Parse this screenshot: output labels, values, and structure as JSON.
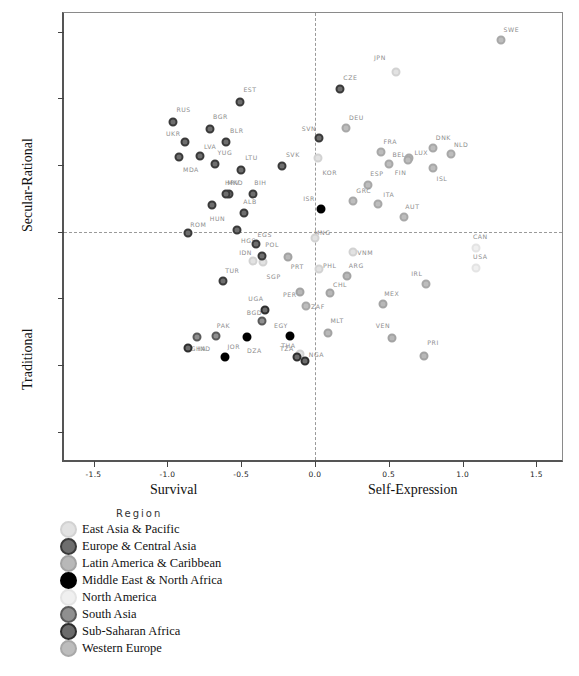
{
  "chart_data": {
    "type": "scatter",
    "title": "",
    "xlabel_left": "Survival",
    "xlabel_right": "Self-Expression",
    "ylabel_top": "Secular-Rational",
    "ylabel_bottom": "Traditional",
    "xlim": [
      -1.7,
      1.68
    ],
    "ylim": [
      -1.72,
      1.64
    ],
    "xticks": [
      "-1.5",
      "-1.0",
      "-0.5",
      "0.0",
      "0.5",
      "1.0",
      "1.5"
    ],
    "xtick_values": [
      -1.5,
      -1.0,
      -0.5,
      0.0,
      0.5,
      1.0,
      1.5
    ],
    "yticks": [
      "1.5",
      "1.0",
      "0.5",
      "0.0",
      "-0.5",
      "-1.0",
      "-1.5"
    ],
    "ytick_values": [
      1.5,
      1.0,
      0.5,
      0.0,
      -0.5,
      -1.0,
      -1.5
    ],
    "grid": false,
    "zero_lines": true,
    "legend_position": "below-plot",
    "legend_title": "Region",
    "series": [
      {
        "name": "East Asia & Pacific",
        "color": "#e2e2e2",
        "stroke": "#d2d2d2",
        "points": [
          {
            "label": "JPN",
            "x": 0.55,
            "y": 1.2,
            "lx": 0.44,
            "ly": 1.31
          },
          {
            "label": "KOR",
            "x": 0.02,
            "y": 0.55,
            "lx": 0.1,
            "ly": 0.45
          },
          {
            "label": "SGP",
            "x": -0.35,
            "y": -0.23,
            "lx": -0.28,
            "ly": -0.33
          },
          {
            "label": "VNM",
            "x": 0.26,
            "y": -0.15,
            "lx": 0.34,
            "ly": -0.15
          },
          {
            "label": "IDN",
            "x": -0.42,
            "y": -0.22,
            "lx": -0.47,
            "ly": -0.15
          },
          {
            "label": "PHL",
            "x": 0.03,
            "y": -0.28,
            "lx": 0.1,
            "ly": -0.25
          },
          {
            "label": "THA",
            "x": -0.1,
            "y": -0.92,
            "lx": -0.18,
            "ly": -0.85
          },
          {
            "label": "MNG",
            "x": 0.0,
            "y": -0.05,
            "lx": 0.05,
            "ly": 0.0
          }
        ]
      },
      {
        "name": "Europe & Central Asia",
        "color": "#6e6e6e",
        "stroke": "#3a3a3a",
        "points": [
          {
            "label": "EST",
            "x": -0.51,
            "y": 0.97,
            "lx": -0.44,
            "ly": 1.07
          },
          {
            "label": "RUS",
            "x": -0.96,
            "y": 0.82,
            "lx": -0.89,
            "ly": 0.92
          },
          {
            "label": "BGR",
            "x": -0.71,
            "y": 0.77,
            "lx": -0.64,
            "ly": 0.87
          },
          {
            "label": "UKR",
            "x": -0.88,
            "y": 0.67,
            "lx": -0.96,
            "ly": 0.74
          },
          {
            "label": "BLR",
            "x": -0.6,
            "y": 0.67,
            "lx": -0.53,
            "ly": 0.76
          },
          {
            "label": "LVA",
            "x": -0.78,
            "y": 0.57,
            "lx": -0.71,
            "ly": 0.64
          },
          {
            "label": "MDA",
            "x": -0.92,
            "y": 0.56,
            "lx": -0.84,
            "ly": 0.47
          },
          {
            "label": "YUG",
            "x": -0.68,
            "y": 0.51,
            "lx": -0.61,
            "ly": 0.6
          },
          {
            "label": "LTU",
            "x": -0.5,
            "y": 0.46,
            "lx": -0.43,
            "ly": 0.56
          },
          {
            "label": "SVK",
            "x": -0.22,
            "y": 0.49,
            "lx": -0.15,
            "ly": 0.58
          },
          {
            "label": "MKD",
            "x": -0.58,
            "y": 0.28,
            "lx": -0.54,
            "ly": 0.37
          },
          {
            "label": "BIH",
            "x": -0.42,
            "y": 0.28,
            "lx": -0.37,
            "ly": 0.37
          },
          {
            "label": "HUN",
            "x": -0.7,
            "y": 0.2,
            "lx": -0.66,
            "ly": 0.1
          },
          {
            "label": "ALB",
            "x": -0.48,
            "y": 0.14,
            "lx": -0.44,
            "ly": 0.23
          },
          {
            "label": "ROM",
            "x": -0.86,
            "y": -0.01,
            "lx": -0.79,
            "ly": 0.06
          },
          {
            "label": "HRV",
            "x": -0.6,
            "y": 0.28,
            "lx": -0.56,
            "ly": 0.37
          },
          {
            "label": "SVN",
            "x": 0.03,
            "y": 0.7,
            "lx": -0.04,
            "ly": 0.78
          },
          {
            "label": "CZE",
            "x": 0.17,
            "y": 1.07,
            "lx": 0.24,
            "ly": 1.16
          },
          {
            "label": "HGS",
            "x": -0.53,
            "y": 0.01,
            "lx": -0.45,
            "ly": -0.06
          },
          {
            "label": "POL",
            "x": -0.36,
            "y": -0.18,
            "lx": -0.29,
            "ly": -0.09
          },
          {
            "label": "TUR",
            "x": -0.62,
            "y": -0.37,
            "lx": -0.56,
            "ly": -0.29
          },
          {
            "label": "EGS",
            "x": -0.4,
            "y": -0.09,
            "lx": -0.34,
            "ly": -0.02
          }
        ]
      },
      {
        "name": "Latin America & Caribbean",
        "color": "#b8b8b8",
        "stroke": "#a3a3a3",
        "points": [
          {
            "label": "ARG",
            "x": 0.22,
            "y": -0.33,
            "lx": 0.28,
            "ly": -0.25
          },
          {
            "label": "CHL",
            "x": 0.1,
            "y": -0.46,
            "lx": 0.17,
            "ly": -0.39
          },
          {
            "label": "MEX",
            "x": 0.46,
            "y": -0.54,
            "lx": 0.52,
            "ly": -0.46
          },
          {
            "label": "VEN",
            "x": 0.52,
            "y": -0.8,
            "lx": 0.46,
            "ly": -0.7
          },
          {
            "label": "PRI",
            "x": 0.74,
            "y": -0.93,
            "lx": 0.8,
            "ly": -0.83
          },
          {
            "label": "PER",
            "x": -0.1,
            "y": -0.45,
            "lx": -0.17,
            "ly": -0.47
          },
          {
            "label": "PRT",
            "x": -0.18,
            "y": -0.19,
            "lx": -0.12,
            "ly": -0.26
          },
          {
            "label": "MLT",
            "x": 0.09,
            "y": -0.76,
            "lx": 0.15,
            "ly": -0.66
          }
        ]
      },
      {
        "name": "Middle East & North Africa",
        "color": "#000000",
        "stroke": "#000000",
        "points": [
          {
            "label": "ISR",
            "x": 0.04,
            "y": 0.17,
            "lx": -0.04,
            "ly": 0.25
          },
          {
            "label": "JOR",
            "x": -0.61,
            "y": -0.94,
            "lx": -0.55,
            "ly": -0.86
          },
          {
            "label": "EGY",
            "x": -0.17,
            "y": -0.78,
            "lx": -0.23,
            "ly": -0.7
          },
          {
            "label": "DZA",
            "x": -0.46,
            "y": -0.79,
            "lx": -0.41,
            "ly": -0.89
          }
        ]
      },
      {
        "name": "North America",
        "color": "#f0f0f0",
        "stroke": "#e4e4e4",
        "points": [
          {
            "label": "CAN",
            "x": 1.09,
            "y": -0.12,
            "lx": 1.12,
            "ly": -0.03
          },
          {
            "label": "USA",
            "x": 1.09,
            "y": -0.27,
            "lx": 1.12,
            "ly": -0.18
          }
        ]
      },
      {
        "name": "South Asia",
        "color": "#8f8f8f",
        "stroke": "#5a5a5a",
        "points": [
          {
            "label": "PAK",
            "x": -0.67,
            "y": -0.78,
            "lx": -0.62,
            "ly": -0.7
          },
          {
            "label": "BGD",
            "x": -0.36,
            "y": -0.67,
            "lx": -0.41,
            "ly": -0.6
          },
          {
            "label": "IND",
            "x": -0.8,
            "y": -0.79,
            "lx": -0.75,
            "ly": -0.87
          }
        ]
      },
      {
        "name": "Sub-Saharan Africa",
        "color": "#6b6b6b",
        "stroke": "#2e2e2e",
        "points": [
          {
            "label": "UGA",
            "x": -0.34,
            "y": -0.59,
            "lx": -0.4,
            "ly": -0.5
          },
          {
            "label": "NGA",
            "x": -0.07,
            "y": -0.97,
            "lx": 0.01,
            "ly": -0.92
          },
          {
            "label": "TZA",
            "x": -0.12,
            "y": -0.94,
            "lx": -0.19,
            "ly": -0.87
          },
          {
            "label": "GHA",
            "x": -0.86,
            "y": -0.87,
            "lx": -0.79,
            "ly": -0.87
          }
        ]
      },
      {
        "name": "Western Europe",
        "color": "#bdbdbd",
        "stroke": "#a8a8a8",
        "points": [
          {
            "label": "SWE",
            "x": 1.26,
            "y": 1.44,
            "lx": 1.33,
            "ly": 1.52
          },
          {
            "label": "DEU",
            "x": 0.21,
            "y": 0.78,
            "lx": 0.28,
            "ly": 0.86
          },
          {
            "label": "DNK",
            "x": 0.8,
            "y": 0.63,
            "lx": 0.87,
            "ly": 0.71
          },
          {
            "label": "NLD",
            "x": 0.92,
            "y": 0.58,
            "lx": 0.99,
            "ly": 0.66
          },
          {
            "label": "FRA",
            "x": 0.45,
            "y": 0.6,
            "lx": 0.51,
            "ly": 0.68
          },
          {
            "label": "BEL",
            "x": 0.5,
            "y": 0.51,
            "lx": 0.57,
            "ly": 0.58
          },
          {
            "label": "LUX",
            "x": 0.64,
            "y": 0.55,
            "lx": 0.72,
            "ly": 0.6
          },
          {
            "label": "FIN",
            "x": 0.63,
            "y": 0.54,
            "lx": 0.58,
            "ly": 0.45
          },
          {
            "label": "ISL",
            "x": 0.8,
            "y": 0.48,
            "lx": 0.86,
            "ly": 0.4
          },
          {
            "label": "ESP",
            "x": 0.36,
            "y": 0.35,
            "lx": 0.42,
            "ly": 0.44
          },
          {
            "label": "GRC",
            "x": 0.26,
            "y": 0.23,
            "lx": 0.33,
            "ly": 0.31
          },
          {
            "label": "ITA",
            "x": 0.43,
            "y": 0.21,
            "lx": 0.5,
            "ly": 0.28
          },
          {
            "label": "AUT",
            "x": 0.6,
            "y": 0.11,
            "lx": 0.66,
            "ly": 0.19
          },
          {
            "label": "IRL",
            "x": 0.75,
            "y": -0.39,
            "lx": 0.69,
            "ly": -0.31
          },
          {
            "label": "ZAF",
            "x": -0.06,
            "y": -0.56,
            "lx": 0.02,
            "ly": -0.56
          }
        ]
      }
    ]
  }
}
